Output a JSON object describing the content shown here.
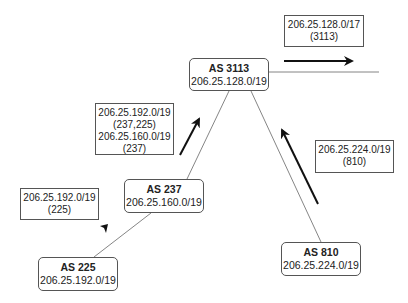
{
  "nodes": [
    {
      "id": "as3113",
      "as": "AS 3113",
      "prefix": "206.25.128.0/19"
    },
    {
      "id": "as237",
      "as": "AS 237",
      "prefix": "206.25.160.0/19"
    },
    {
      "id": "as225",
      "as": "AS 225",
      "prefix": "206.25.192.0/19"
    },
    {
      "id": "as810",
      "as": "AS 810",
      "prefix": "206.25.224.0/19"
    }
  ],
  "announcements": [
    {
      "id": "upstream",
      "lines": [
        "206.25.128.0/17",
        "(3113)"
      ]
    },
    {
      "id": "from237",
      "lines": [
        "206.25.192.0/19",
        "(237,225)",
        "206.25.160.0/19",
        "(237)"
      ]
    },
    {
      "id": "from225",
      "lines": [
        "206.25.192.0/19",
        "(225)"
      ]
    },
    {
      "id": "from810",
      "lines": [
        "206.25.224.0/19",
        "(810)"
      ]
    }
  ],
  "colors": {
    "line": "#555555",
    "arrow": "#111111",
    "border": "#555555"
  }
}
